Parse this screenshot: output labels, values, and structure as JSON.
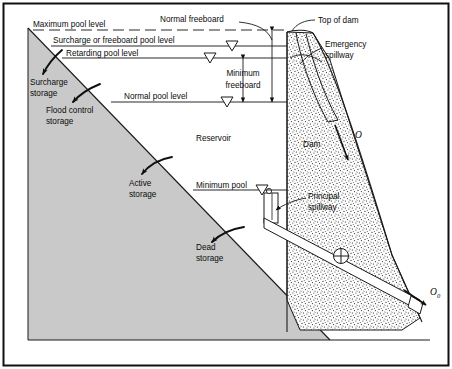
{
  "figure": {
    "border_color": "#111111",
    "background": "#ffffff"
  },
  "colors": {
    "terrain_fill": "#c9c9c9",
    "terrain_stroke": "#1a1a1a",
    "dam_fill": "#fdfdfd",
    "dam_stipple": "#1d1d1d",
    "line": "#1a1a1a",
    "water_line": "#2a2a2a",
    "text": "#0b0b0b"
  },
  "pool_levels": [
    {
      "id": "maximum-pool-level",
      "label": "Maximum pool level",
      "style": "dashed",
      "y": 30
    },
    {
      "id": "surcharge-pool-level",
      "label": "Surcharge or freeboard pool level",
      "style": "solid",
      "y": 46
    },
    {
      "id": "retarding-pool-level",
      "label": "Retarding pool level",
      "style": "solid",
      "y": 58
    },
    {
      "id": "normal-pool-level",
      "label": "Normal pool level",
      "style": "solid",
      "y": 102
    },
    {
      "id": "minimum-pool-level",
      "label": "Minimum pool",
      "style": "solid",
      "y": 190
    }
  ],
  "storage_zones": [
    {
      "id": "surcharge-storage",
      "label_line1": "Surcharge",
      "label_line2": "storage"
    },
    {
      "id": "flood-control-storage",
      "label_line1": "Flood control",
      "label_line2": "storage"
    },
    {
      "id": "active-storage",
      "label_line1": "Active",
      "label_line2": "storage"
    },
    {
      "id": "dead-storage",
      "label_line1": "Dead",
      "label_line2": "storage"
    }
  ],
  "freeboard": {
    "normal_label": "Normal freeboard",
    "minimum_label_line1": "Minimum",
    "minimum_label_line2": "freeboard"
  },
  "structures": {
    "reservoir_label": "Reservoir",
    "dam_label": "Dam",
    "top_of_dam_label": "Top of dam",
    "emergency_spillway_line1": "Emergency",
    "emergency_spillway_line2": "spillway",
    "principal_spillway_line1": "Principal",
    "principal_spillway_line2": "spillway"
  },
  "flow_symbols": [
    {
      "id": "emergency-outflow",
      "symbol": "O",
      "subscript": ""
    },
    {
      "id": "principal-outflow",
      "symbol": "O",
      "subscript": "0"
    }
  ]
}
